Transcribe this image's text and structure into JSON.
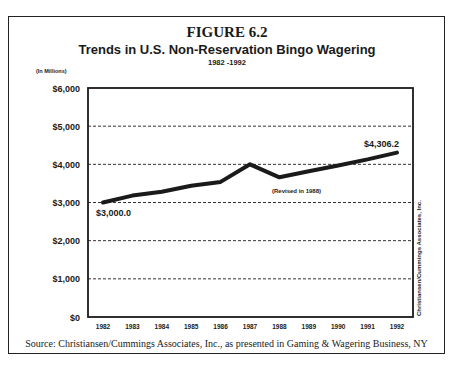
{
  "figure": {
    "label": "FIGURE 6.2",
    "title": "Trends in U.S. Non-Reservation Bingo Wagering",
    "subtitle": "1982 -1992",
    "unit_label": "(In Millions)",
    "source": "Source: Christiansen/Cummings Associates, Inc., as presented in Gaming & Wagering Business, NY",
    "side_credit": "Christiansen/Cummings Associates, Inc."
  },
  "annotations": {
    "start_value": "$3,000.0",
    "end_value": "$4,306.2",
    "revision_note": "(Revised in 1988)"
  },
  "chart_data": {
    "type": "line",
    "title": "Trends in U.S. Non-Reservation Bingo Wagering",
    "subtitle": "1982 -1992",
    "xlabel": "",
    "ylabel": "(In Millions)",
    "categories": [
      "1982",
      "1983",
      "1984",
      "1985",
      "1986",
      "1987",
      "1988",
      "1989",
      "1990",
      "1991",
      "1992"
    ],
    "series": [
      {
        "name": "Non-Reservation Bingo Wagering ($ millions)",
        "values": [
          3000.0,
          3180,
          3280,
          3440,
          3540,
          4000,
          3660,
          3820,
          3970,
          4130,
          4306.2
        ]
      }
    ],
    "ylim": [
      0,
      6000
    ],
    "yticks": [
      0,
      1000,
      2000,
      3000,
      4000,
      5000,
      6000
    ],
    "ytick_labels": [
      "$0",
      "$1,000",
      "$2,000",
      "$3,000",
      "$4,000",
      "$5,000",
      "$6,000"
    ],
    "grid": "horizontal dashed",
    "legend": "none",
    "annotations": [
      {
        "text": "$3,000.0",
        "at": "1982"
      },
      {
        "text": "$4,306.2",
        "at": "1992"
      },
      {
        "text": "(Revised in 1988)",
        "at": "1988"
      }
    ],
    "line_color": "#1a1a1a"
  }
}
